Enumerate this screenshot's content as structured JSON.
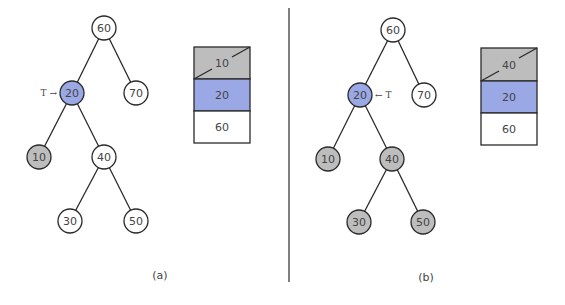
{
  "colors": {
    "highlight": "#9aa8e6",
    "visited": "#bdbdbd",
    "plain": "#ffffff",
    "stroke": "#2a2a2a"
  },
  "panels": [
    {
      "caption": "(a)",
      "pointer": {
        "text": "T →",
        "target": "20"
      },
      "tree": {
        "nodes": [
          {
            "id": "60",
            "label": "60",
            "state": "plain"
          },
          {
            "id": "20",
            "label": "20",
            "state": "highlight"
          },
          {
            "id": "70",
            "label": "70",
            "state": "plain"
          },
          {
            "id": "10",
            "label": "10",
            "state": "visited"
          },
          {
            "id": "40",
            "label": "40",
            "state": "plain"
          },
          {
            "id": "30",
            "label": "30",
            "state": "plain"
          },
          {
            "id": "50",
            "label": "50",
            "state": "plain"
          }
        ]
      },
      "stack": [
        {
          "label": "10",
          "state": "popped"
        },
        {
          "label": "20",
          "state": "highlight"
        },
        {
          "label": "60",
          "state": "plain"
        }
      ]
    },
    {
      "caption": "(b)",
      "pointer": {
        "text": "← T",
        "target": "20"
      },
      "tree": {
        "nodes": [
          {
            "id": "60",
            "label": "60",
            "state": "plain"
          },
          {
            "id": "20",
            "label": "20",
            "state": "highlight"
          },
          {
            "id": "70",
            "label": "70",
            "state": "plain"
          },
          {
            "id": "10",
            "label": "10",
            "state": "visited"
          },
          {
            "id": "40",
            "label": "40",
            "state": "visited"
          },
          {
            "id": "30",
            "label": "30",
            "state": "visited"
          },
          {
            "id": "50",
            "label": "50",
            "state": "visited"
          }
        ]
      },
      "stack": [
        {
          "label": "40",
          "state": "popped"
        },
        {
          "label": "20",
          "state": "highlight"
        },
        {
          "label": "60",
          "state": "plain"
        }
      ]
    }
  ]
}
